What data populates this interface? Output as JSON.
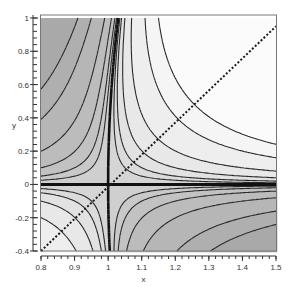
{
  "chart_data": {
    "type": "contour",
    "title": "",
    "xlabel": "x",
    "ylabel": "y",
    "xlim": [
      0.8,
      1.5
    ],
    "ylim": [
      -0.4,
      1.0
    ],
    "x_ticks": [
      0.8,
      0.9,
      1.0,
      1.1,
      1.2,
      1.3,
      1.4,
      1.5
    ],
    "x_tick_labels": [
      "0.8",
      "0.9",
      "1",
      "1.1",
      "1.2",
      "1.3",
      "1.4",
      "1.5"
    ],
    "y_ticks": [
      -0.4,
      -0.2,
      0.0,
      0.2,
      0.4,
      0.6,
      0.8,
      1.0
    ],
    "y_tick_labels": [
      "-0.4",
      "-0.2",
      "0",
      "0.2",
      "0.4",
      "0.6",
      "0.8",
      "1"
    ],
    "x_minor_step": 0.02,
    "y_minor_step": 0.04,
    "grid": false,
    "legend": null,
    "function_approx": "f(x,y) = y * (x - 1 - 0.03*y^2)",
    "contour_levels": [
      -0.12,
      -0.08,
      -0.04,
      -0.02,
      -0.01,
      -0.005,
      0,
      0.005,
      0.01,
      0.02,
      0.04,
      0.08,
      0.12
    ],
    "zero_contours": [
      "y = 0",
      "x ≈ 1 + 0.03*y^2"
    ],
    "shading": "grayscale: positive (x>1,y>0 and x<1,y<0) lighter, negative darker",
    "dotted_line": {
      "x": [
        0.8,
        1.5
      ],
      "y": [
        -0.4,
        0.95
      ],
      "style": "dotted"
    },
    "colors": {
      "darkest": "#a9a9a9",
      "lightest": "#fbfbfb",
      "contour_line": "#2a2a2a",
      "zero_line": "#111111"
    }
  },
  "labels": {
    "x_axis": "x",
    "y_axis": "y"
  }
}
